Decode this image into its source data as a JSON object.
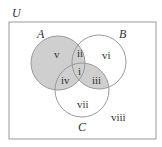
{
  "diagram": {
    "type": "venn",
    "universe_label": "U",
    "sets": [
      {
        "label": "A",
        "cx": 58,
        "cy": 63,
        "r": 27
      },
      {
        "label": "B",
        "cx": 99,
        "cy": 62,
        "r": 27
      },
      {
        "label": "C",
        "cx": 82,
        "cy": 90,
        "r": 27
      }
    ],
    "regions": [
      {
        "id": "i",
        "sets": [
          "A",
          "B",
          "C"
        ],
        "shaded": true
      },
      {
        "id": "ii",
        "sets": [
          "A",
          "B"
        ],
        "shaded": true
      },
      {
        "id": "iii",
        "sets": [
          "B",
          "C"
        ],
        "shaded": true
      },
      {
        "id": "iv",
        "sets": [
          "A",
          "C"
        ],
        "shaded": true
      },
      {
        "id": "v",
        "sets": [
          "A"
        ],
        "shaded": true
      },
      {
        "id": "vi",
        "sets": [
          "B"
        ],
        "shaded": false
      },
      {
        "id": "vii",
        "sets": [
          "C"
        ],
        "shaded": false
      },
      {
        "id": "viii",
        "sets": [],
        "shaded": false
      }
    ],
    "colors": {
      "shade": "#cfcfcf",
      "stroke": "#9a9a9a",
      "text": "#333333"
    }
  }
}
